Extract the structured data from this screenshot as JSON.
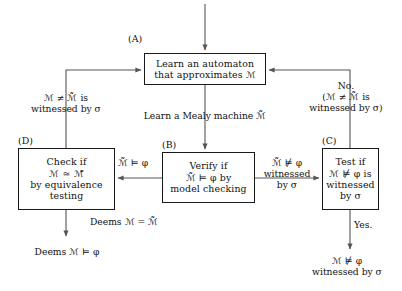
{
  "diagram": {
    "type": "flowchart",
    "symbols": {
      "M": "ℳ",
      "M_tilde": "ℳ̃",
      "phi": "φ",
      "sigma": "σ",
      "models": "⊨",
      "not_models": "⊭",
      "neq": "≠",
      "approx_eq": "≃",
      "eq": "="
    },
    "nodes": [
      {
        "id": "A",
        "tag": "(A)",
        "lines": [
          "Learn an automaton",
          "that approximates ℳ"
        ]
      },
      {
        "id": "B",
        "tag": "(B)",
        "lines": [
          "Verify if",
          "ℳ̃ ⊨ φ by",
          "model checking"
        ]
      },
      {
        "id": "C",
        "tag": "(C)",
        "lines": [
          "Test if",
          "ℳ ⊭ φ is",
          "witnessed",
          "by σ"
        ]
      },
      {
        "id": "D",
        "tag": "(D)",
        "lines": [
          "Check if",
          "ℳ ≃ ℳ̃",
          "by equivalence",
          "testing"
        ]
      }
    ],
    "edge_labels": {
      "a_to_b": [
        "Learn a Mealy machine ℳ̃"
      ],
      "b_to_d": [
        "ℳ̃ ⊨ φ"
      ],
      "b_to_c": [
        "ℳ̃ ⊭ φ",
        "witnessed",
        "by σ"
      ],
      "d_to_a": [
        "ℳ ≠ ℳ̃ is",
        "witnessed by σ"
      ],
      "c_to_a": [
        "No.",
        "(ℳ ≠ ℳ̃ is",
        "witnessed by σ)"
      ],
      "d_out": [
        "Deems ℳ = ℳ̃"
      ],
      "c_out": [
        "Yes."
      ]
    },
    "terminals": {
      "bottom_left": [
        "Deems ℳ ⊨ φ"
      ],
      "bottom_right": [
        "ℳ ⊭ φ",
        "witnessed by σ"
      ]
    },
    "style": {
      "stroke": "#555555",
      "box_border": "#1a1a1a",
      "text": "#111111",
      "background": "#ffffff"
    }
  }
}
